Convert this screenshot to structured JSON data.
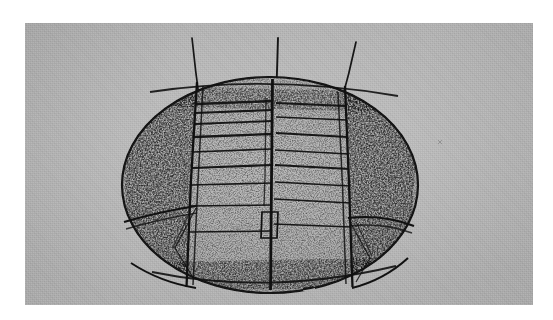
{
  "page": {
    "width": 553,
    "height": 320,
    "background_color": "#ffffff",
    "content_type": "halftone-scanned-figure-plate"
  },
  "plate": {
    "name": "specimen-figure-plate",
    "x": 25,
    "y": 23,
    "width": 508,
    "height": 282,
    "paper_tone": "#b9b9b9",
    "ink_color": "#1a1a1a",
    "texture": "newsprint-halftone-screen"
  },
  "specimen": {
    "label": "ovoid-specimen",
    "shape": "ellipse",
    "center_x": 270,
    "center_y": 185,
    "radius_x": 148,
    "radius_y": 108,
    "fill_tone": "#b2b2b2",
    "outline_color": "#141414",
    "outline_width": 2.1,
    "stipple_density": "dense-at-margins"
  },
  "needles": [
    {
      "name": "needle-left",
      "x1": 192,
      "y1": 38,
      "x2": 200,
      "y2": 104,
      "tilt": "near-vertical"
    },
    {
      "name": "needle-center",
      "x1": 278,
      "y1": 38,
      "x2": 276,
      "y2": 100,
      "tilt": "vertical"
    },
    {
      "name": "needle-right",
      "x1": 356,
      "y1": 42,
      "x2": 340,
      "y2": 106,
      "tilt": "slanted-left"
    }
  ],
  "panels": {
    "left_margin_panel": "stippled crescent, left of first division",
    "center_left_panel": "striated field between left and middle division",
    "center_right_panel": "striated field between middle and right division",
    "right_margin_panel": "stippled crescent, right of third division"
  },
  "divisions": [
    {
      "name": "division-left",
      "top_x": 196,
      "bottom_x": 186
    },
    {
      "name": "division-center",
      "top_x": 272,
      "bottom_x": 270
    },
    {
      "name": "division-right",
      "top_x": 344,
      "bottom_x": 352
    }
  ],
  "striations": {
    "left_field_rows": 9,
    "right_field_rows": 8,
    "orientation": "horizontal",
    "spacing": "uneven, denser toward the top"
  },
  "wedges": [
    {
      "name": "wedge-lower-left",
      "note": "angular cut segment with diagonal crease"
    },
    {
      "name": "wedge-lower-right",
      "note": "mirrored angular cut segment with diagonal crease"
    }
  ],
  "notch": {
    "name": "central-basal-notch",
    "x": 262,
    "y": 212,
    "width": 16,
    "height": 26
  }
}
